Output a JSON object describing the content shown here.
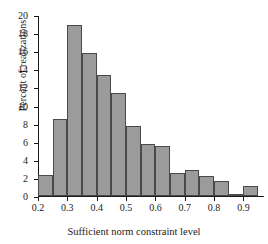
{
  "chart_data": {
    "type": "bar",
    "title": "",
    "xlabel": "Sufficient norm constraint level",
    "ylabel": "Percent of realizations",
    "xlim": [
      0.2,
      0.97
    ],
    "ylim": [
      0,
      20
    ],
    "grid": false,
    "legend": null,
    "bin_width": 0.05,
    "bin_edges": [
      0.2,
      0.25,
      0.3,
      0.35,
      0.4,
      0.45,
      0.5,
      0.55,
      0.6,
      0.65,
      0.7,
      0.75,
      0.8,
      0.85,
      0.9,
      0.95
    ],
    "categories": [
      "0.20-0.25",
      "0.25-0.30",
      "0.30-0.35",
      "0.35-0.40",
      "0.40-0.45",
      "0.45-0.50",
      "0.50-0.55",
      "0.55-0.60",
      "0.60-0.65",
      "0.65-0.70",
      "0.70-0.75",
      "0.75-0.80",
      "0.80-0.85",
      "0.85-0.90",
      "0.90-0.95"
    ],
    "values": [
      2.3,
      8.5,
      18.9,
      15.8,
      13.4,
      11.4,
      7.7,
      5.7,
      5.5,
      2.5,
      2.85,
      2.2,
      1.7,
      0.2,
      1.1
    ],
    "xticks": [
      0.2,
      0.3,
      0.4,
      0.5,
      0.6,
      0.7,
      0.8,
      0.9
    ],
    "xtick_labels": [
      "0.2",
      "0.3",
      "0.4",
      "0.5",
      "0.6",
      "0.7",
      "0.8",
      "0.9"
    ],
    "yticks": [
      0,
      2,
      4,
      6,
      8,
      10,
      12,
      14,
      16,
      18,
      20
    ],
    "ytick_labels": [
      "0",
      "2",
      "4",
      "6",
      "8",
      "10",
      "12",
      "14",
      "16",
      "18",
      "20"
    ],
    "bar_color": "#9b9b9b",
    "bar_edge_color": "#4a4a4a",
    "axis_color": "#1a1a1a"
  }
}
